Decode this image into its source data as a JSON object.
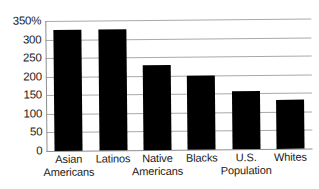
{
  "chart_data": {
    "type": "bar",
    "title": "",
    "xlabel": "",
    "ylabel": "",
    "ylim": [
      0,
      350
    ],
    "grid": true,
    "legend": "none",
    "orientation": "vertical",
    "bar_color": "#000000",
    "gridline_color": "#a9a9a9",
    "axis_color": "#8e8e8e",
    "y_unit": "%",
    "yticks": [
      0,
      50,
      100,
      150,
      200,
      250,
      300,
      350
    ],
    "ytick_labels": [
      "0",
      "50",
      "100",
      "150",
      "200",
      "250",
      "300",
      "350%"
    ],
    "categories": [
      "Asian Americans",
      "Latinos",
      "Native Americans",
      "Blacks",
      "U.S. Population",
      "Whites"
    ],
    "category_lines": [
      [
        "Asian",
        "Americans"
      ],
      [
        "Latinos",
        ""
      ],
      [
        "Native",
        "Americans"
      ],
      [
        "Blacks",
        ""
      ],
      [
        "U.S.",
        "Population"
      ],
      [
        "Whites",
        ""
      ]
    ],
    "values": [
      325,
      325,
      228,
      200,
      155,
      133
    ]
  }
}
